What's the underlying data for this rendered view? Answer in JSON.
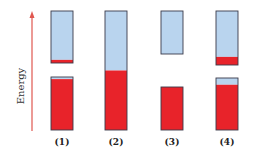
{
  "figure": {
    "axis_label": "Energy",
    "colors": {
      "filled": "#e8232a",
      "empty": "#b9d4ee",
      "outline": "#3a3a4a",
      "arrow": "#e0574f"
    },
    "columns": [
      {
        "label": "(1)",
        "bands": [
          {
            "name": "upper-band",
            "segments": [
              {
                "state": "empty",
                "fraction": 0.94
              },
              {
                "state": "filled",
                "fraction": 0.06
              }
            ]
          },
          {
            "name": "lower-band",
            "segments": [
              {
                "state": "empty",
                "fraction": 0.04
              },
              {
                "state": "filled",
                "fraction": 0.96
              }
            ]
          }
        ]
      },
      {
        "label": "(2)",
        "bands": [
          {
            "name": "single-band",
            "segments": [
              {
                "state": "empty",
                "fraction": 0.5
              },
              {
                "state": "filled",
                "fraction": 0.5
              }
            ]
          }
        ]
      },
      {
        "label": "(3)",
        "bands": [
          {
            "name": "upper-band",
            "segments": [
              {
                "state": "empty",
                "fraction": 1.0
              }
            ]
          },
          {
            "name": "lower-band",
            "segments": [
              {
                "state": "filled",
                "fraction": 1.0
              }
            ]
          }
        ]
      },
      {
        "label": "(4)",
        "bands": [
          {
            "name": "upper-band",
            "segments": [
              {
                "state": "empty",
                "fraction": 0.85
              },
              {
                "state": "filled",
                "fraction": 0.15
              }
            ]
          },
          {
            "name": "lower-band",
            "segments": [
              {
                "state": "empty",
                "fraction": 0.13
              },
              {
                "state": "filled",
                "fraction": 0.87
              }
            ]
          }
        ]
      }
    ]
  }
}
